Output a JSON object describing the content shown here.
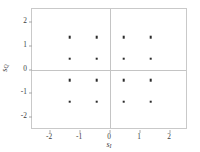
{
  "chart_data": {
    "type": "scatter",
    "title": "",
    "subtitle": "",
    "xlabel": "s_I",
    "ylabel": "s_Q",
    "xlabel_base": "s",
    "xlabel_sub": "I",
    "ylabel_base": "s",
    "ylabel_sub": "Q",
    "xlim": [
      -2.6,
      2.6
    ],
    "ylim": [
      -2.55,
      2.55
    ],
    "xticks": [
      -2,
      -1,
      0,
      1,
      2
    ],
    "yticks": [
      -2,
      -1,
      0,
      1,
      2
    ],
    "xticklabels": [
      "-2",
      "-1",
      "0",
      "1",
      "2"
    ],
    "yticklabels": [
      "-2",
      "-1",
      "0",
      "1",
      "2"
    ],
    "grid": false,
    "zero_lines": true,
    "legend": null,
    "marker": "square",
    "marker_color": "#2b2b2b",
    "axis_color": "#c9c9c9",
    "series": [
      {
        "name": "16-QAM constellation",
        "x": [
          -1.35,
          -0.45,
          0.45,
          1.35,
          -1.35,
          -0.45,
          0.45,
          1.35,
          -1.35,
          -0.45,
          0.45,
          1.35,
          -1.35,
          -0.45,
          0.45,
          1.35
        ],
        "y": [
          1.35,
          1.35,
          1.35,
          1.35,
          0.45,
          0.45,
          0.45,
          0.45,
          -0.45,
          -0.45,
          -0.45,
          -0.45,
          -1.35,
          -1.35,
          -1.35,
          -1.35
        ]
      }
    ]
  }
}
